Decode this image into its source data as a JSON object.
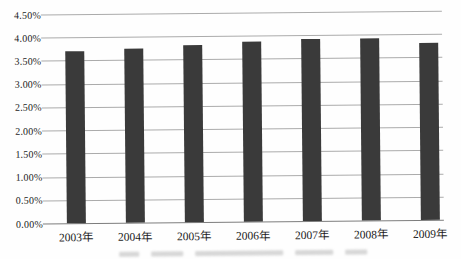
{
  "chart_data": {
    "type": "bar",
    "title": "",
    "xlabel": "",
    "ylabel": "",
    "categories": [
      "2003年",
      "2004年",
      "2005年",
      "2006年",
      "2007年",
      "2008年",
      "2009年"
    ],
    "values": [
      3.7,
      3.75,
      3.81,
      3.87,
      3.91,
      3.93,
      3.82
    ],
    "unit": "%",
    "ylim": [
      0,
      4.5
    ],
    "ytick_step": 0.5,
    "ytick_labels": [
      "4.50%",
      "4.00%",
      "3.50%",
      "3.00%",
      "2.50%",
      "2.00%",
      "1.50%",
      "1.00%",
      "0.50%",
      "0.00%"
    ],
    "grid": true,
    "legend_position": "none",
    "bar_color": "#3a3a3a",
    "gridline_color": "#ababab",
    "axis_line_color": "#7d7d7d",
    "label_color": "#1b1b1b"
  }
}
